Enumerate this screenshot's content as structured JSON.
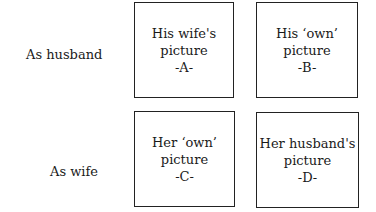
{
  "rows": [
    {
      "label": "As husband",
      "boxes": [
        {
          "line1": "His wife's",
          "line2": "picture",
          "tag": "-A-"
        },
        {
          "line1": "His ‘own’",
          "line2": "picture",
          "tag": "-B-"
        }
      ]
    },
    {
      "label": "As wife",
      "boxes": [
        {
          "line1": "Her ‘own’",
          "line2": "picture",
          "tag": "-C-"
        },
        {
          "line1": "Her husband's",
          "line2": "picture",
          "tag": "-D-"
        }
      ]
    }
  ]
}
